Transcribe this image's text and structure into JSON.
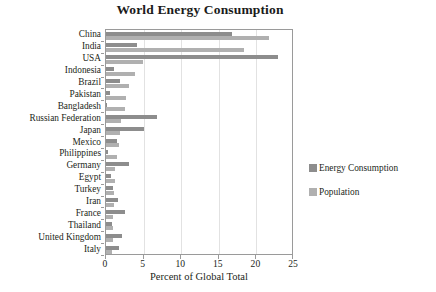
{
  "chart_data": {
    "type": "bar",
    "orientation": "horizontal",
    "title": "World Energy Consumption",
    "xlabel": "Percent of Global Total",
    "ylabel": "",
    "xlim": [
      0,
      25
    ],
    "xticks": [
      0,
      5,
      10,
      15,
      20,
      25
    ],
    "xtick_labels": [
      "0",
      "5",
      "10",
      "15",
      "20",
      "25"
    ],
    "grid": true,
    "legend_position": "right",
    "categories": [
      "China",
      "India",
      "USA",
      "Indonesia",
      "Brazil",
      "Pakistan",
      "Bangladesh",
      "Russian Federation",
      "Japan",
      "Mexico",
      "Philippines",
      "Germany",
      "Egypt",
      "Turkey",
      "Iran",
      "France",
      "Thailand",
      "United Kingdom",
      "Italy"
    ],
    "series": [
      {
        "name": "Energy Consumption",
        "color": "#8d8d8d",
        "values": [
          16.7,
          4.1,
          22.9,
          1.0,
          1.8,
          0.5,
          0.1,
          6.8,
          5.0,
          1.4,
          0.2,
          3.1,
          0.6,
          0.9,
          1.6,
          2.5,
          0.8,
          2.1,
          1.7
        ]
      },
      {
        "name": "Population",
        "color": "#b0b0b0",
        "values": [
          21.7,
          18.4,
          4.9,
          3.8,
          3.0,
          2.6,
          2.5,
          2.0,
          1.8,
          1.7,
          1.4,
          1.2,
          1.2,
          1.1,
          1.1,
          0.9,
          0.9,
          0.9,
          0.8
        ]
      }
    ]
  },
  "legend": {
    "entries": [
      {
        "label": "Energy Consumption",
        "color": "#8d8d8d"
      },
      {
        "label": "Population",
        "color": "#b0b0b0"
      }
    ]
  }
}
